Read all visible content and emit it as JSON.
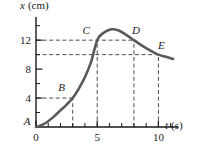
{
  "chart_data": {
    "type": "line",
    "title": "",
    "xlabel": "t (s)",
    "ylabel": "x (cm)",
    "xlabel_var": "t",
    "xlabel_unit": "(s)",
    "ylabel_var": "x",
    "ylabel_unit": "(cm)",
    "xlim": [
      0,
      11.6
    ],
    "ylim": [
      0,
      15.2
    ],
    "grid": false,
    "legend": "none",
    "xticks_major": [
      0,
      5,
      10
    ],
    "xtick_labels": [
      "0",
      "5",
      "10"
    ],
    "xticks_minor": [
      1,
      2,
      3,
      4,
      6,
      7,
      8,
      9,
      11
    ],
    "yticks_major": [
      4,
      8,
      12
    ],
    "ytick_labels": [
      "4",
      "8",
      "12"
    ],
    "yticks_minor": [
      2,
      6,
      10,
      14
    ],
    "series": [
      {
        "name": "position",
        "x": [
          0,
          0.5,
          1,
          1.5,
          2,
          2.5,
          3,
          3.5,
          4,
          4.5,
          5,
          5.5,
          6,
          6.3,
          6.8,
          7.3,
          8,
          8.6,
          9.2,
          10,
          10.6,
          11.2
        ],
        "y": [
          0,
          0.3,
          0.8,
          1.5,
          2.3,
          3.1,
          4.0,
          5.3,
          6.9,
          9.0,
          12.0,
          13.0,
          13.45,
          13.5,
          13.3,
          12.8,
          12.0,
          11.3,
          10.7,
          10.0,
          9.7,
          9.4
        ]
      }
    ],
    "annotations": [
      {
        "label": "A",
        "x": 0,
        "y": 0,
        "label_dx": -9,
        "label_dy": -2
      },
      {
        "label": "B",
        "x": 3,
        "y": 4,
        "label_dx": -11,
        "label_dy": -7
      },
      {
        "label": "C",
        "x": 5,
        "y": 12,
        "label_dx": -11,
        "label_dy": -6
      },
      {
        "label": "D",
        "x": 8,
        "y": 12,
        "label_dx": 2,
        "label_dy": -6
      },
      {
        "label": "E",
        "x": 10,
        "y": 10,
        "label_dx": 3,
        "label_dy": -6
      }
    ],
    "guides_horizontal": [
      {
        "y": 4,
        "from_x": 0,
        "to_x": 3
      },
      {
        "y": 12,
        "from_x": 0,
        "to_x": 8
      },
      {
        "y": 10,
        "from_x": 0,
        "to_x": 10
      }
    ],
    "guides_vertical": [
      {
        "x": 3,
        "from_y": 0,
        "to_y": 4
      },
      {
        "x": 5,
        "from_y": 0,
        "to_y": 12
      },
      {
        "x": 8,
        "from_y": 0,
        "to_y": 12
      },
      {
        "x": 10,
        "from_y": 0,
        "to_y": 10
      }
    ],
    "colors": {
      "curve": "#5a5a5a",
      "axis": "#1a1a1a",
      "guide": "#3a3a3a",
      "text": "#1a1a1a",
      "background": "#ffffff"
    }
  }
}
